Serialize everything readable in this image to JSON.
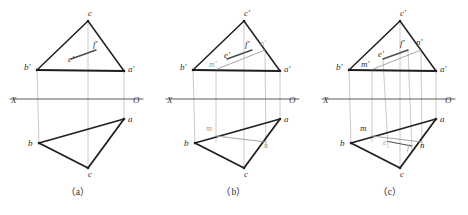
{
  "figure": {
    "colors": {
      "background": "#ffffff",
      "heavy_line": "#1f1f1f",
      "medium_line": "#4a4a4a",
      "light_line": "#9b9b9b",
      "faint_line": "#bdbdbd",
      "axis_line": "#5a5a5a",
      "label_text": "#2e2e2e",
      "faint_text": "#9a9a9a",
      "caption_text": "#2b2b2b"
    },
    "axis": {
      "x_label": "X",
      "o_label": "O"
    },
    "panels": [
      {
        "id": "a",
        "caption": "（a）",
        "labels_primary": [
          {
            "name": "c-top",
            "text": "c",
            "x": 88,
            "y": 16
          },
          {
            "name": "b-prime",
            "text": "b′",
            "x": 24,
            "y": 70
          },
          {
            "name": "a-prime",
            "text": "a′",
            "x": 128,
            "y": 72
          },
          {
            "name": "b-lower",
            "text": "b",
            "x": 28,
            "y": 146
          },
          {
            "name": "a-lower",
            "text": "a",
            "x": 128,
            "y": 122
          },
          {
            "name": "c-bottom",
            "text": "c",
            "x": 88,
            "y": 177
          },
          {
            "name": "e-prime",
            "text": "e′",
            "x": 68,
            "y": 62
          },
          {
            "name": "f-prime",
            "text": "f′",
            "x": 93,
            "y": 47
          }
        ],
        "labels_faint": []
      },
      {
        "id": "b",
        "caption": "（b）",
        "labels_primary": [
          {
            "name": "c-prime-top",
            "text": "c′",
            "x": 88,
            "y": 16
          },
          {
            "name": "b-prime",
            "text": "b′",
            "x": 24,
            "y": 70
          },
          {
            "name": "a-prime",
            "text": "a′",
            "x": 128,
            "y": 72
          },
          {
            "name": "b-lower",
            "text": "b",
            "x": 28,
            "y": 146
          },
          {
            "name": "a-lower",
            "text": "a",
            "x": 128,
            "y": 122
          },
          {
            "name": "c-bottom",
            "text": "c",
            "x": 88,
            "y": 177
          },
          {
            "name": "e-prime",
            "text": "e′",
            "x": 68,
            "y": 58
          },
          {
            "name": "f-prime",
            "text": "f′",
            "x": 89,
            "y": 47
          }
        ],
        "labels_faint": [
          {
            "name": "m-prime",
            "text": "m′",
            "x": 53,
            "y": 67
          },
          {
            "name": "n-prime",
            "text": "n′",
            "x": 104,
            "y": 46
          },
          {
            "name": "m-lower",
            "text": "m",
            "x": 50,
            "y": 131
          },
          {
            "name": "n-lower",
            "text": "n",
            "x": 108,
            "y": 148
          }
        ]
      },
      {
        "id": "c",
        "caption": "（c）",
        "labels_primary": [
          {
            "name": "c-prime-top",
            "text": "c′",
            "x": 88,
            "y": 16
          },
          {
            "name": "b-prime",
            "text": "b′",
            "x": 24,
            "y": 70
          },
          {
            "name": "a-prime",
            "text": "a′",
            "x": 128,
            "y": 72
          },
          {
            "name": "b-lower",
            "text": "b",
            "x": 28,
            "y": 146
          },
          {
            "name": "a-lower",
            "text": "a",
            "x": 128,
            "y": 122
          },
          {
            "name": "c-bottom",
            "text": "c",
            "x": 88,
            "y": 177
          },
          {
            "name": "e-prime",
            "text": "e′",
            "x": 66,
            "y": 57
          },
          {
            "name": "f-prime",
            "text": "f′",
            "x": 88,
            "y": 46
          },
          {
            "name": "m-prime",
            "text": "m′",
            "x": 49,
            "y": 67
          },
          {
            "name": "n-prime",
            "text": "n′",
            "x": 104,
            "y": 45
          },
          {
            "name": "m-lower",
            "text": "m",
            "x": 48,
            "y": 131
          },
          {
            "name": "n-lower",
            "text": "n",
            "x": 108,
            "y": 148
          }
        ],
        "labels_faint": [
          {
            "name": "e-lower",
            "text": "e",
            "x": 71,
            "y": 145
          },
          {
            "name": "f-lower",
            "text": "f",
            "x": 95,
            "y": 150
          }
        ]
      }
    ],
    "geometry": {
      "note": "Shared vertex coordinates within each 156x215 panel",
      "c_top": [
        88,
        21
      ],
      "b_prime": [
        37,
        70
      ],
      "a_prime": [
        124,
        71
      ],
      "b_lower": [
        39,
        143
      ],
      "a_lower": [
        124,
        119
      ],
      "c_bottom": [
        88,
        168
      ],
      "axis_y": 99,
      "axis_x_start": 10,
      "axis_x_end": 143
    }
  }
}
